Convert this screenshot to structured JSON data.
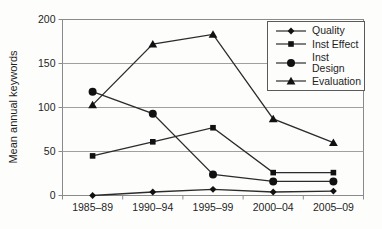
{
  "chart_data": {
    "type": "line",
    "title": "",
    "xlabel": "",
    "ylabel": "Mean annual keywords",
    "categories": [
      "1985–89",
      "1990–94",
      "1995–99",
      "2000–04",
      "2005–09"
    ],
    "y_ticks": [
      0,
      50,
      100,
      150,
      200
    ],
    "ylim": [
      0,
      200
    ],
    "grid": true,
    "legend_position": "upper-right",
    "series": [
      {
        "name": "Quality",
        "marker": "diamond",
        "values": [
          0,
          4,
          7,
          4,
          5
        ]
      },
      {
        "name": "Inst Effect",
        "marker": "square",
        "values": [
          45,
          61,
          77,
          26,
          26
        ]
      },
      {
        "name": "Inst Design",
        "marker": "circle",
        "values": [
          118,
          93,
          24,
          16,
          16
        ]
      },
      {
        "name": "Evaluation",
        "marker": "triangle",
        "values": [
          103,
          172,
          183,
          87,
          60
        ]
      }
    ],
    "colors": {
      "series": "#2b2b2b",
      "marker": "#111111",
      "grid": "#a0a0a0",
      "frame": "#8a8a8a",
      "text": "#1f1f1f",
      "background": "#fdfdfc",
      "legend_border": "#5a5a5a"
    }
  }
}
